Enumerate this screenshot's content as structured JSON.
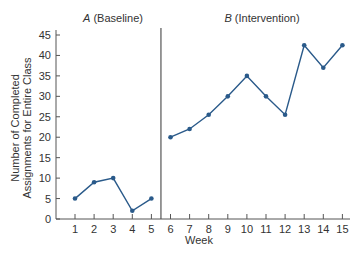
{
  "chart_data": {
    "type": "line",
    "title": "",
    "xlabel": "Week",
    "ylabel": "Number of Completed Assignments for Entire Class",
    "ylabel_lines": [
      "Number of Completed",
      "Assignments for Entire Class"
    ],
    "ylim": [
      0,
      45
    ],
    "xlim": [
      0,
      15
    ],
    "yticks": [
      0,
      5,
      10,
      15,
      20,
      25,
      30,
      35,
      40,
      45
    ],
    "xticks": [
      1,
      2,
      3,
      4,
      5,
      6,
      7,
      8,
      9,
      10,
      11,
      12,
      13,
      14,
      15
    ],
    "grid": false,
    "legend": "none",
    "phase_change_after_week": 5.5,
    "phases": [
      {
        "letter": "A",
        "name": "(Baseline)"
      },
      {
        "letter": "B",
        "name": "(Intervention)"
      }
    ],
    "series": [
      {
        "name": "A (Baseline)",
        "x": [
          1,
          2,
          3,
          4,
          5
        ],
        "values": [
          5,
          9,
          10,
          2,
          5
        ]
      },
      {
        "name": "B (Intervention)",
        "x": [
          6,
          7,
          8,
          9,
          10,
          11,
          12,
          13,
          14,
          15
        ],
        "values": [
          20,
          22,
          25.5,
          30,
          35,
          30,
          25.5,
          42.5,
          37,
          42.5
        ]
      }
    ],
    "colors": {
      "line": "#2a5a8a",
      "axis": "#555555",
      "text": "#333333"
    }
  }
}
